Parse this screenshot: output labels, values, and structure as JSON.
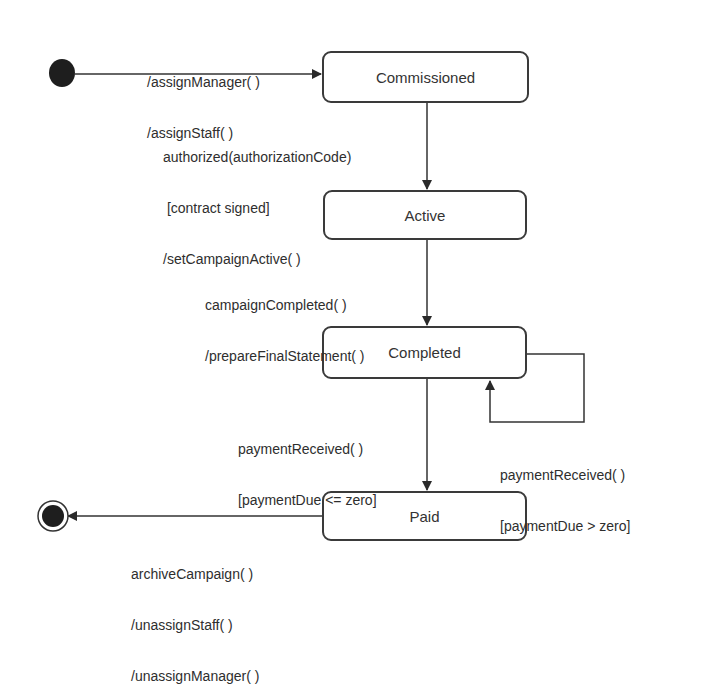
{
  "diagram": {
    "type": "uml-state-machine",
    "states": [
      {
        "id": "commissioned",
        "label": "Commissioned"
      },
      {
        "id": "active",
        "label": "Active"
      },
      {
        "id": "completed",
        "label": "Completed"
      },
      {
        "id": "paid",
        "label": "Paid"
      }
    ],
    "pseudostates": {
      "initial": "initial-state",
      "final": "final-state"
    },
    "transitions": {
      "initial_to_commissioned": {
        "lines": [
          "/assignManager( )",
          "/assignStaff( )"
        ]
      },
      "commissioned_to_active": {
        "lines": [
          "authorized(authorizationCode)",
          " [contract signed]",
          "/setCampaignActive( )"
        ]
      },
      "active_to_completed": {
        "lines": [
          "campaignCompleted( )",
          "/prepareFinalStatement( )"
        ]
      },
      "completed_to_paid": {
        "lines": [
          "paymentReceived( )",
          "[paymentDue <= zero]"
        ]
      },
      "completed_self_loop": {
        "lines": [
          "paymentReceived( )",
          "[paymentDue > zero]"
        ]
      },
      "paid_to_final": {
        "lines": [
          "archiveCampaign( )",
          "/unassignStaff( )",
          "/unassignManager( )"
        ]
      }
    },
    "colors": {
      "line": "#333333",
      "fill": "#ffffff",
      "dot": "#1e1e1e"
    }
  }
}
